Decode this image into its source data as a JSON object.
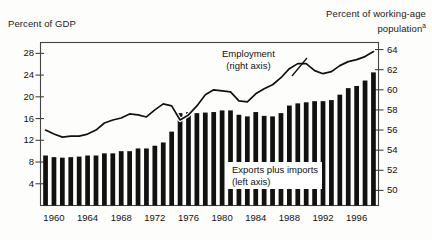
{
  "titles": {
    "left_axis_title": "Percent of GDP",
    "right_axis_title_line1": "Percent of working-age",
    "right_axis_title_line2": "population",
    "right_axis_title_footnote": "a"
  },
  "annotations": {
    "series_line_label_line1": "Employment",
    "series_line_label_line2": "(right axis)",
    "series_bar_label_line1": "Exports plus imports",
    "series_bar_label_line2": "(left axis)"
  },
  "colors": {
    "bar_fill": "#111111",
    "line_stroke": "#111111",
    "axis": "#444444",
    "background": "#fdfdfb",
    "text": "#111111"
  },
  "chart_data": {
    "type": "bar",
    "title": "",
    "subtitle": "",
    "xlabel": "",
    "ylabel": "Percent of GDP",
    "y2label": "Percent of working-age population",
    "grid": false,
    "legend_position": "inline-annotation",
    "ylim": [
      0,
      30
    ],
    "y2lim": [
      48.5,
      64.7
    ],
    "xlim": [
      1958.4,
      1998.6
    ],
    "yticks": [
      4,
      8,
      12,
      16,
      20,
      24,
      28
    ],
    "y2ticks": [
      50,
      52,
      54,
      56,
      58,
      60,
      62,
      64
    ],
    "xticks": [
      1960,
      1964,
      1968,
      1972,
      1976,
      1980,
      1984,
      1988,
      1992,
      1996
    ],
    "xticklabels": [
      "1960",
      "1964",
      "1968",
      "1972",
      "1976",
      "1980",
      "1984",
      "1988",
      "1992",
      "1996"
    ],
    "x": [
      1959,
      1960,
      1961,
      1962,
      1963,
      1964,
      1965,
      1966,
      1967,
      1968,
      1969,
      1970,
      1971,
      1972,
      1973,
      1974,
      1975,
      1976,
      1977,
      1978,
      1979,
      1980,
      1981,
      1982,
      1983,
      1984,
      1985,
      1986,
      1987,
      1988,
      1989,
      1990,
      1991,
      1992,
      1993,
      1994,
      1995,
      1996,
      1997,
      1998
    ],
    "series": [
      {
        "name": "Exports plus imports",
        "axis": "left",
        "type": "bar",
        "units": "Percent of GDP",
        "values": [
          9.2,
          8.9,
          8.8,
          8.9,
          9.0,
          9.2,
          9.2,
          9.6,
          9.6,
          10.0,
          10.0,
          10.5,
          10.5,
          11.0,
          11.6,
          13.6,
          17.0,
          17.2,
          17.0,
          17.1,
          17.2,
          17.5,
          17.5,
          16.7,
          16.4,
          17.2,
          16.5,
          16.4,
          17.0,
          18.4,
          18.8,
          19.0,
          19.2,
          19.2,
          19.4,
          20.4,
          21.6,
          22.0,
          23.0,
          24.5
        ]
      },
      {
        "name": "Employment",
        "axis": "right",
        "type": "line",
        "units": "Percent of working-age population",
        "values": [
          56.0,
          55.6,
          55.3,
          55.4,
          55.4,
          55.6,
          56.0,
          56.7,
          57.0,
          57.2,
          57.6,
          57.5,
          57.3,
          58.0,
          58.6,
          58.4,
          57.0,
          57.5,
          58.4,
          59.5,
          60.0,
          59.9,
          59.8,
          58.9,
          58.8,
          59.6,
          60.1,
          60.5,
          61.2,
          62.1,
          62.6,
          62.6,
          61.9,
          61.6,
          61.8,
          62.4,
          62.8,
          63.0,
          63.3,
          63.8
        ]
      }
    ]
  }
}
